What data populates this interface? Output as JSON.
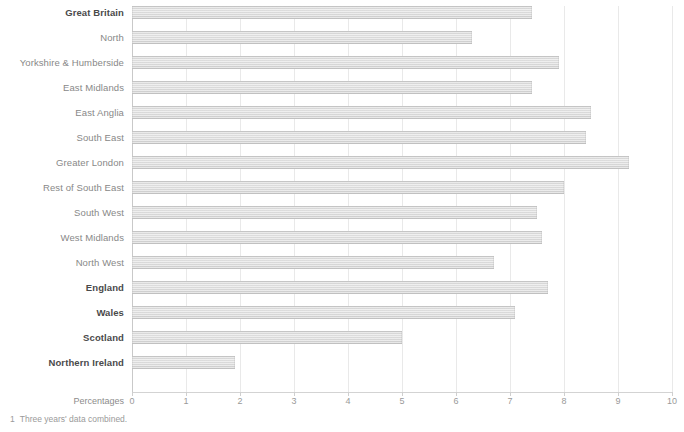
{
  "chart_data": {
    "type": "bar",
    "orientation": "horizontal",
    "title": "",
    "subtitle": "",
    "xlabel": "Percentages",
    "ylabel": "",
    "xlim": [
      0,
      10
    ],
    "xticks": [
      "0",
      "1",
      "2",
      "3",
      "4",
      "5",
      "6",
      "7",
      "8",
      "9",
      "10"
    ],
    "grid": true,
    "legend": null,
    "categories": [
      "Great Britain",
      "North",
      "Yorkshire & Humberside",
      "East Midlands",
      "East Anglia",
      "South East",
      "Greater London",
      "Rest of South East",
      "South West",
      "West Midlands",
      "North West",
      "England",
      "Wales",
      "Scotland",
      "Northern Ireland"
    ],
    "values": [
      7.4,
      6.3,
      7.9,
      7.4,
      8.5,
      8.4,
      9.2,
      8.0,
      7.5,
      7.6,
      6.7,
      7.7,
      7.1,
      5.0,
      1.9
    ],
    "emphasis": [
      true,
      false,
      false,
      false,
      false,
      false,
      false,
      false,
      false,
      false,
      false,
      true,
      true,
      true,
      true
    ],
    "bar_color": "#d5d5d5",
    "grid_color": "#e9e9e9",
    "axis_color": "#d3d3d3"
  },
  "footnote": {
    "number": "1",
    "text": "Three years' data combined."
  }
}
